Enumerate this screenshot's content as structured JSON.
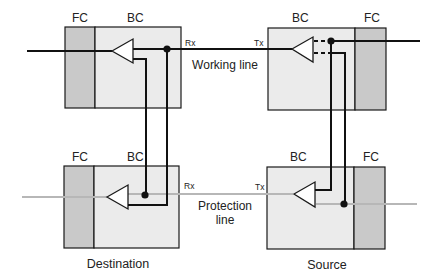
{
  "colors": {
    "background": "#ffffff",
    "fc_fill": "#c9c9c9",
    "bc_fill": "#ebebeb",
    "working_line": "#111111",
    "protection_line": "#b7b7b7",
    "stroke": "#1a1a1a"
  },
  "nodes": {
    "destination": {
      "caption": "Destination",
      "working": {
        "fc_label": "FC",
        "bc_label": "BC",
        "port_label": "Rx"
      },
      "protection": {
        "fc_label": "FC",
        "bc_label": "BC",
        "port_label": "Rx"
      }
    },
    "source": {
      "caption": "Source",
      "working": {
        "fc_label": "FC",
        "bc_label": "BC",
        "port_label": "Tx"
      },
      "protection": {
        "fc_label": "FC",
        "bc_label": "BC",
        "port_label": "Tx"
      }
    }
  },
  "lines": {
    "working": {
      "label": "Working line"
    },
    "protection": {
      "label_line1": "Protection",
      "label_line2": "line"
    }
  }
}
